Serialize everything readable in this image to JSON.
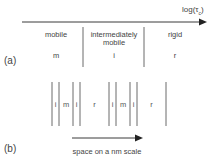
{
  "panel_a": {
    "label": "(a)",
    "axis_label": "log(τ",
    "axis_label_sub": "c",
    "axis_label_close": ")",
    "regions": [
      {
        "name": "mobile",
        "abbr": "m"
      },
      {
        "name": "intermediately mobile",
        "abbr": "i"
      },
      {
        "name": "rigid",
        "abbr": "r"
      }
    ]
  },
  "panel_b": {
    "label": "(b)",
    "segments": [
      "i",
      "m",
      "i",
      "r",
      "i",
      "m",
      "i",
      "r"
    ],
    "axis_label": "space on a nm scale"
  },
  "colors": {
    "line": "#3a3a3a",
    "divider": "#6a6a6a",
    "text": "#444444"
  }
}
